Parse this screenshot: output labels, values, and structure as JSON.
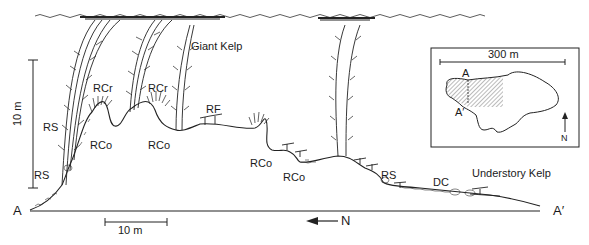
{
  "diagram": {
    "type": "kelp-forest-cross-section",
    "labels": {
      "giant_kelp": "Giant Kelp",
      "understory_kelp": "Understory Kelp",
      "rs_1": "RS",
      "rs_2": "RS",
      "rs_3": "RS",
      "rcr_1": "RCr",
      "rcr_2": "RCr",
      "rco_1": "RCo",
      "rco_2": "RCo",
      "rco_3": "RCo",
      "rco_4": "RCo",
      "rf": "RF",
      "dc": "DC",
      "point_a": "A",
      "point_a_prime": "A′"
    },
    "vertical_scale": {
      "label": "10 m"
    },
    "horizontal_scale": {
      "label": "10 m"
    },
    "north_arrow": {
      "label": "N",
      "direction": "left"
    },
    "inset_map": {
      "scale_label": "300 m",
      "point_a": "A",
      "point_a_prime": "A′",
      "north_label": "N",
      "north_direction": "up"
    }
  }
}
